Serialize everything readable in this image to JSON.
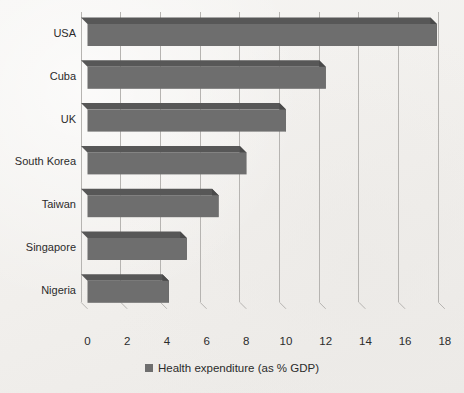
{
  "chart_data": {
    "type": "bar",
    "orientation": "horizontal",
    "title": "",
    "xlabel": "",
    "ylabel": "",
    "categories": [
      "USA",
      "Cuba",
      "UK",
      "South Korea",
      "Taiwan",
      "Singapore",
      "Nigeria"
    ],
    "values": [
      17.6,
      12.0,
      10.0,
      8.0,
      6.6,
      5.0,
      4.1
    ],
    "series": [
      {
        "name": "Health expenditure (as % GDP)",
        "values": [
          17.6,
          12.0,
          10.0,
          8.0,
          6.6,
          5.0,
          4.1
        ]
      }
    ],
    "xlim": [
      0,
      18
    ],
    "xticks": [
      0,
      2,
      4,
      6,
      8,
      10,
      12,
      14,
      16,
      18
    ],
    "xtick_labels": [
      "0",
      "2",
      "4",
      "6",
      "8",
      "10",
      "12",
      "14",
      "16",
      "18"
    ],
    "grid": "vertical",
    "legend": {
      "position": "bottom",
      "entries": [
        {
          "label": "Health expenditure (as % GDP)",
          "marker": "square",
          "color": "#6e6e6e"
        }
      ]
    },
    "style": {
      "bar_face_color": "#6e6e6e",
      "bar_top_color": "#575757",
      "bar_side_color": "#4a4a4a",
      "gridline_color": "#b6b4b1",
      "background_color": "#f4f3f1",
      "text_color": "#2b2b2b",
      "effect": "3d"
    }
  },
  "legend_label": "Health expenditure (as % GDP)"
}
